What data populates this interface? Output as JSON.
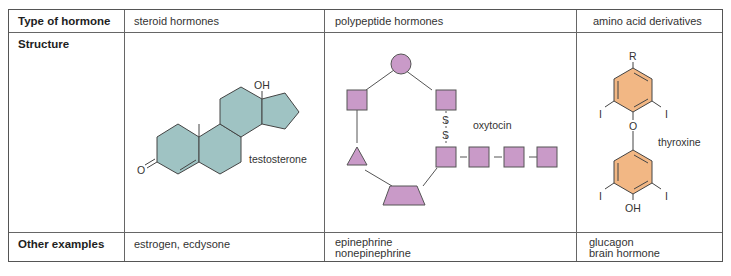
{
  "table": {
    "row_headers": [
      "Type of hormone",
      "Structure",
      "Other examples"
    ],
    "columns": [
      {
        "type": "steroid hormones",
        "structure_label": "testosterone",
        "structure_atoms": [
          "OH",
          "O"
        ],
        "other_examples": [
          "estrogen, ecdysone"
        ]
      },
      {
        "type": "polypeptide hormones",
        "structure_label": "oxytocin",
        "structure_atoms": [
          "S",
          "S"
        ],
        "other_examples": [
          "epinephrine",
          "nonepinephrine"
        ]
      },
      {
        "type": "amino acid derivatives",
        "structure_label": "thyroxine",
        "structure_atoms": [
          "R",
          "I",
          "I",
          "O",
          "I",
          "I",
          "OH"
        ],
        "other_examples": [
          "glucagon",
          "brain hormone"
        ]
      }
    ]
  },
  "colors": {
    "steroid_fill": "#9fc3c3",
    "peptide_fill": "#c99ac8",
    "amino_fill": "#f2b784",
    "border": "#555555",
    "line": "#444444"
  }
}
